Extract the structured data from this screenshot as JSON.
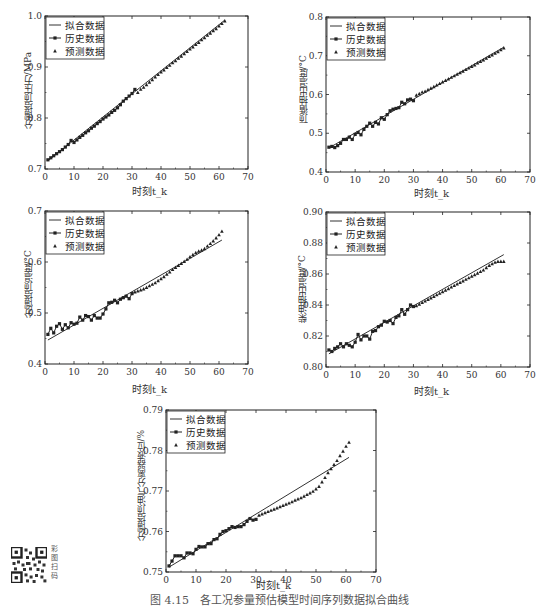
{
  "caption": "图 4.15　各工况参量预估模型时间序列数据拟合曲线",
  "qr": {
    "label": "彩图扫码",
    "icon": "qr-code-icon"
  },
  "legend_labels": [
    "拟合数据",
    "历史数据",
    "预测数据"
  ],
  "chart_data": [
    {
      "type": "line",
      "title": "",
      "xlabel": "时刻t_k",
      "ylabel": "分馏塔顶压力/MPa",
      "xlim": [
        0,
        70
      ],
      "ylim": [
        0.7,
        1.0
      ],
      "xticks": [
        0,
        10,
        20,
        30,
        40,
        50,
        60,
        70
      ],
      "yticks": [
        0.7,
        0.8,
        0.9,
        1.0
      ],
      "ytick_labels": [
        "0.7",
        "0.8",
        "0.9",
        "1.0"
      ],
      "legend": [
        "拟合数据",
        "历史数据",
        "预测数据"
      ],
      "legend_position": "upper left",
      "series": [
        {
          "name": "拟合数据",
          "style": "line",
          "x": [
            1,
            62
          ],
          "y": [
            0.716,
            0.992
          ]
        },
        {
          "name": "历史数据",
          "style": "line-square",
          "x": [
            1,
            2,
            3,
            4,
            5,
            6,
            7,
            8,
            9,
            10,
            11,
            12,
            13,
            14,
            15,
            16,
            17,
            18,
            19,
            20,
            21,
            22,
            23,
            24,
            25,
            26,
            27,
            28,
            29,
            30,
            31
          ],
          "y": [
            0.718,
            0.722,
            0.726,
            0.73,
            0.734,
            0.738,
            0.743,
            0.748,
            0.756,
            0.752,
            0.757,
            0.762,
            0.766,
            0.771,
            0.775,
            0.78,
            0.784,
            0.789,
            0.793,
            0.798,
            0.802,
            0.806,
            0.811,
            0.815,
            0.82,
            0.826,
            0.833,
            0.838,
            0.843,
            0.848,
            0.856
          ]
        },
        {
          "name": "预测数据",
          "style": "triangle",
          "x": [
            32,
            33,
            34,
            35,
            36,
            37,
            38,
            39,
            40,
            41,
            42,
            43,
            44,
            45,
            46,
            47,
            48,
            49,
            50,
            51,
            52,
            53,
            54,
            55,
            56,
            57,
            58,
            59,
            60,
            61,
            62
          ],
          "y": [
            0.85,
            0.856,
            0.86,
            0.865,
            0.87,
            0.875,
            0.88,
            0.885,
            0.89,
            0.894,
            0.899,
            0.903,
            0.908,
            0.912,
            0.917,
            0.921,
            0.926,
            0.93,
            0.935,
            0.939,
            0.944,
            0.948,
            0.953,
            0.957,
            0.962,
            0.966,
            0.971,
            0.975,
            0.98,
            0.985,
            0.99
          ]
        }
      ]
    },
    {
      "type": "line",
      "title": "",
      "xlabel": "时刻t_k",
      "ylabel": "顶循抽出温度/°C",
      "xlim": [
        0,
        70
      ],
      "ylim": [
        0.4,
        0.8
      ],
      "xticks": [
        0,
        10,
        20,
        30,
        40,
        50,
        60,
        70
      ],
      "yticks": [
        0.4,
        0.5,
        0.6,
        0.7,
        0.8
      ],
      "ytick_labels": [
        "0.4",
        "0.5",
        "0.6",
        "0.7",
        "0.8"
      ],
      "legend": [
        "拟合数据",
        "历史数据",
        "预测数据"
      ],
      "legend_position": "upper left",
      "series": [
        {
          "name": "拟合数据",
          "style": "line",
          "x": [
            1,
            61
          ],
          "y": [
            0.462,
            0.722
          ]
        },
        {
          "name": "历史数据",
          "style": "line-square",
          "x": [
            1,
            2,
            3,
            4,
            5,
            6,
            7,
            8,
            9,
            10,
            11,
            12,
            13,
            14,
            15,
            16,
            17,
            18,
            19,
            20,
            21,
            22,
            23,
            24,
            25,
            26,
            27,
            28,
            29,
            30
          ],
          "y": [
            0.464,
            0.466,
            0.463,
            0.468,
            0.474,
            0.484,
            0.484,
            0.49,
            0.484,
            0.497,
            0.502,
            0.496,
            0.51,
            0.518,
            0.526,
            0.518,
            0.528,
            0.524,
            0.54,
            0.536,
            0.548,
            0.558,
            0.562,
            0.564,
            0.566,
            0.58,
            0.576,
            0.586,
            0.588,
            0.584
          ]
        },
        {
          "name": "预测数据",
          "style": "triangle",
          "x": [
            31,
            32,
            33,
            34,
            35,
            36,
            37,
            38,
            39,
            40,
            41,
            42,
            43,
            44,
            45,
            46,
            47,
            48,
            49,
            50,
            51,
            52,
            53,
            54,
            55,
            56,
            57,
            58,
            59,
            60,
            61
          ],
          "y": [
            0.598,
            0.602,
            0.606,
            0.608,
            0.612,
            0.616,
            0.62,
            0.624,
            0.628,
            0.632,
            0.636,
            0.64,
            0.644,
            0.648,
            0.652,
            0.656,
            0.66,
            0.664,
            0.668,
            0.672,
            0.676,
            0.681,
            0.685,
            0.689,
            0.693,
            0.698,
            0.702,
            0.706,
            0.71,
            0.715,
            0.72
          ]
        }
      ]
    },
    {
      "type": "line",
      "title": "",
      "xlabel": "时刻t_k",
      "ylabel": "分馏塔顶温度/°C",
      "xlim": [
        0,
        70
      ],
      "ylim": [
        0.4,
        0.7
      ],
      "xticks": [
        0,
        10,
        20,
        30,
        40,
        50,
        60,
        70
      ],
      "yticks": [
        0.4,
        0.5,
        0.6,
        0.7
      ],
      "ytick_labels": [
        "0.4",
        "0.5",
        "0.6",
        "0.7"
      ],
      "legend": [
        "拟合数据",
        "历史数据",
        "预测数据"
      ],
      "legend_position": "upper left",
      "series": [
        {
          "name": "拟合数据",
          "style": "line",
          "x": [
            1,
            61
          ],
          "y": [
            0.447,
            0.643
          ]
        },
        {
          "name": "历史数据",
          "style": "line-square",
          "x": [
            1,
            2,
            3,
            4,
            5,
            6,
            7,
            8,
            9,
            10,
            11,
            12,
            13,
            14,
            15,
            16,
            17,
            18,
            19,
            20,
            21,
            22,
            23,
            24,
            25,
            26,
            27,
            28,
            29,
            30
          ],
          "y": [
            0.458,
            0.47,
            0.461,
            0.474,
            0.479,
            0.468,
            0.477,
            0.471,
            0.481,
            0.478,
            0.48,
            0.492,
            0.486,
            0.495,
            0.493,
            0.486,
            0.495,
            0.49,
            0.49,
            0.498,
            0.508,
            0.52,
            0.521,
            0.525,
            0.52,
            0.527,
            0.53,
            0.533,
            0.528,
            0.538
          ]
        },
        {
          "name": "预测数据",
          "style": "triangle",
          "x": [
            31,
            32,
            33,
            34,
            35,
            36,
            37,
            38,
            39,
            40,
            41,
            42,
            43,
            44,
            45,
            46,
            47,
            48,
            49,
            50,
            51,
            52,
            53,
            54,
            55,
            56,
            57,
            58,
            59,
            60,
            61
          ],
          "y": [
            0.541,
            0.543,
            0.545,
            0.547,
            0.55,
            0.553,
            0.556,
            0.559,
            0.563,
            0.567,
            0.571,
            0.576,
            0.58,
            0.585,
            0.589,
            0.593,
            0.597,
            0.601,
            0.605,
            0.61,
            0.614,
            0.618,
            0.621,
            0.623,
            0.626,
            0.631,
            0.636,
            0.641,
            0.647,
            0.653,
            0.66
          ]
        }
      ]
    },
    {
      "type": "line",
      "title": "",
      "xlabel": "时刻t_k",
      "ylabel": "柴油抽出温度/°C",
      "xlim": [
        0,
        70
      ],
      "ylim": [
        0.8,
        0.9
      ],
      "xticks": [
        0,
        10,
        20,
        30,
        40,
        50,
        60,
        70
      ],
      "yticks": [
        0.8,
        0.82,
        0.84,
        0.86,
        0.88,
        0.9
      ],
      "ytick_labels": [
        "0.80",
        "0.82",
        "0.84",
        "0.86",
        "0.88",
        "0.90"
      ],
      "legend": [
        "拟合数据",
        "历史数据",
        "预测数据"
      ],
      "legend_position": "upper left",
      "series": [
        {
          "name": "拟合数据",
          "style": "line",
          "x": [
            1,
            61
          ],
          "y": [
            0.8085,
            0.8725
          ]
        },
        {
          "name": "历史数据",
          "style": "line-square",
          "x": [
            1,
            2,
            3,
            4,
            5,
            6,
            7,
            8,
            9,
            10,
            11,
            12,
            13,
            14,
            15,
            16,
            17,
            18,
            19,
            20,
            21,
            22,
            23,
            24,
            25,
            26,
            27,
            28,
            29,
            30
          ],
          "y": [
            0.811,
            0.81,
            0.812,
            0.813,
            0.815,
            0.813,
            0.815,
            0.814,
            0.813,
            0.816,
            0.821,
            0.8175,
            0.82,
            0.82,
            0.818,
            0.823,
            0.8235,
            0.826,
            0.827,
            0.8295,
            0.829,
            0.83,
            0.828,
            0.832,
            0.833,
            0.837,
            0.834,
            0.837,
            0.84,
            0.839
          ]
        },
        {
          "name": "预测数据",
          "style": "triangle",
          "x": [
            31,
            32,
            33,
            34,
            35,
            36,
            37,
            38,
            39,
            40,
            41,
            42,
            43,
            44,
            45,
            46,
            47,
            48,
            49,
            50,
            51,
            52,
            53,
            54,
            55,
            56,
            57,
            58,
            59,
            60,
            61
          ],
          "y": [
            0.8395,
            0.8405,
            0.8415,
            0.8425,
            0.8435,
            0.8445,
            0.8455,
            0.8465,
            0.8475,
            0.8485,
            0.8495,
            0.8505,
            0.8515,
            0.8525,
            0.8535,
            0.8545,
            0.8555,
            0.8565,
            0.8575,
            0.8585,
            0.8595,
            0.8605,
            0.8615,
            0.8625,
            0.864,
            0.8655,
            0.8665,
            0.8675,
            0.868,
            0.868,
            0.868
          ]
        }
      ]
    },
    {
      "type": "line",
      "title": "",
      "xlabel": "时刻t_k",
      "ylabel": "分馏塔顶油气分离器液位/%",
      "xlim": [
        0,
        70
      ],
      "ylim": [
        0.75,
        0.79
      ],
      "xticks": [
        0,
        10,
        20,
        30,
        40,
        50,
        60,
        70
      ],
      "yticks": [
        0.75,
        0.76,
        0.77,
        0.78,
        0.79
      ],
      "ytick_labels": [
        "0.75",
        "0.76",
        "0.77",
        "0.78",
        "0.79"
      ],
      "legend": [
        "拟合数据",
        "历史数据",
        "预测数据"
      ],
      "legend_position": "upper left",
      "series": [
        {
          "name": "拟合数据",
          "style": "line",
          "x": [
            1,
            61
          ],
          "y": [
            0.7512,
            0.7783
          ]
        },
        {
          "name": "历史数据",
          "style": "line-square",
          "x": [
            1,
            2,
            3,
            4,
            5,
            6,
            7,
            8,
            9,
            10,
            11,
            12,
            13,
            14,
            15,
            16,
            17,
            18,
            19,
            20,
            21,
            22,
            23,
            24,
            25,
            26,
            27,
            28,
            29,
            30
          ],
          "y": [
            0.7515,
            0.7527,
            0.754,
            0.754,
            0.754,
            0.7535,
            0.7547,
            0.7547,
            0.7545,
            0.7556,
            0.7563,
            0.7562,
            0.7562,
            0.757,
            0.757,
            0.758,
            0.7582,
            0.7593,
            0.76,
            0.7602,
            0.7607,
            0.7612,
            0.761,
            0.7612,
            0.7612,
            0.7617,
            0.7625,
            0.7632,
            0.7628,
            0.763
          ]
        },
        {
          "name": "预测数据",
          "style": "triangle",
          "x": [
            31,
            32,
            33,
            34,
            35,
            36,
            37,
            38,
            39,
            40,
            41,
            42,
            43,
            44,
            45,
            46,
            47,
            48,
            49,
            50,
            51,
            52,
            53,
            54,
            55,
            56,
            57,
            58,
            59,
            60,
            61
          ],
          "y": [
            0.764,
            0.7643,
            0.7646,
            0.7649,
            0.7652,
            0.7655,
            0.7658,
            0.7661,
            0.7664,
            0.7667,
            0.767,
            0.7673,
            0.7677,
            0.768,
            0.7683,
            0.7687,
            0.7691,
            0.7695,
            0.7699,
            0.7705,
            0.7711,
            0.7722,
            0.7733,
            0.7745,
            0.7755,
            0.7765,
            0.7775,
            0.7787,
            0.7798,
            0.781,
            0.782
          ]
        }
      ]
    }
  ]
}
